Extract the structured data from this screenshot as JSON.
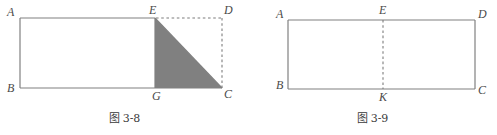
{
  "page": {
    "width": 497,
    "height": 135,
    "background": "#ffffff",
    "stroke_color": "#808080",
    "dash_color": "#8a8a8a",
    "shade_color": "#808080",
    "label_color": "#4a4a4a"
  },
  "figures": [
    {
      "id": "figure-3-8",
      "caption_cjk": "图",
      "caption_number": "3-8",
      "caption_full": "图 3-8",
      "shape_type": "rectangle-with-shaded-right-triangle",
      "shaded_region": "triangle EGC",
      "vertices": [
        {
          "name": "A",
          "label": "A",
          "x": 20,
          "y": 18
        },
        {
          "name": "E",
          "label": "E",
          "x": 155,
          "y": 18
        },
        {
          "name": "D",
          "label": "D",
          "x": 222,
          "y": 18
        },
        {
          "name": "B",
          "label": "B",
          "x": 20,
          "y": 88
        },
        {
          "name": "G",
          "label": "G",
          "x": 155,
          "y": 88
        },
        {
          "name": "C",
          "label": "C",
          "x": 222,
          "y": 88
        }
      ],
      "solid_edges": [
        "A-E",
        "A-B",
        "B-G",
        "B-C",
        "E-G",
        "G-C",
        "E-C"
      ],
      "dashed_edges": [
        "E-D",
        "D-C"
      ],
      "labels": [
        {
          "text": "A",
          "x": 7,
          "y": 6
        },
        {
          "text": "E",
          "x": 149,
          "y": 4
        },
        {
          "text": "D",
          "x": 224,
          "y": 4
        },
        {
          "text": "B",
          "x": 7,
          "y": 82
        },
        {
          "text": "G",
          "x": 152,
          "y": 90
        },
        {
          "text": "C",
          "x": 224,
          "y": 88
        }
      ]
    },
    {
      "id": "figure-3-9",
      "caption_cjk": "图",
      "caption_number": "3-9",
      "caption_full": "图 3-9",
      "shape_type": "rectangle-with-vertical-dashed-midline",
      "shaded_region": "",
      "vertices": [
        {
          "name": "A",
          "label": "A",
          "x": 40,
          "y": 20
        },
        {
          "name": "E",
          "label": "E",
          "x": 135,
          "y": 20
        },
        {
          "name": "D",
          "label": "D",
          "x": 227,
          "y": 20
        },
        {
          "name": "B",
          "label": "B",
          "x": 40,
          "y": 89
        },
        {
          "name": "K",
          "label": "K",
          "x": 135,
          "y": 89
        },
        {
          "name": "C",
          "label": "C",
          "x": 227,
          "y": 89
        }
      ],
      "solid_edges": [
        "A-D",
        "A-B",
        "B-C",
        "D-C"
      ],
      "dashed_edges": [
        "E-K"
      ],
      "labels": [
        {
          "text": "A",
          "x": 28,
          "y": 8
        },
        {
          "text": "E",
          "x": 131,
          "y": 4
        },
        {
          "text": "D",
          "x": 230,
          "y": 8
        },
        {
          "text": "B",
          "x": 28,
          "y": 79
        },
        {
          "text": "K",
          "x": 131,
          "y": 91
        },
        {
          "text": "C",
          "x": 230,
          "y": 84
        }
      ]
    }
  ]
}
